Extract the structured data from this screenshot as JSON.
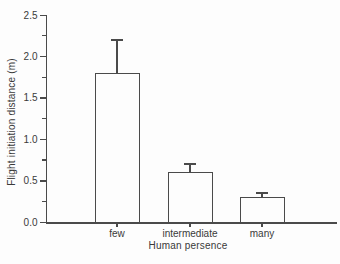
{
  "chart_data": {
    "type": "bar",
    "categories": [
      "few",
      "intermediate",
      "many"
    ],
    "values": [
      1.8,
      0.6,
      0.3
    ],
    "errors_upper": [
      0.4,
      0.1,
      0.05
    ],
    "title": "",
    "xlabel": "Human persence",
    "ylabel": "Flight initiation distance (m)",
    "ylim": [
      0,
      2.5
    ],
    "ytick_step": 0.5,
    "yminor_step": 0.25,
    "ytick_labels": [
      "0.0",
      "0.5",
      "1.0",
      "1.5",
      "2.0",
      "2.5"
    ],
    "grid": false,
    "legend": "none",
    "bar_fill": "#fdfdfd",
    "line_color": "#4a4a4a",
    "text_color": "#3a3a3a",
    "background": "#fdfdfd"
  }
}
